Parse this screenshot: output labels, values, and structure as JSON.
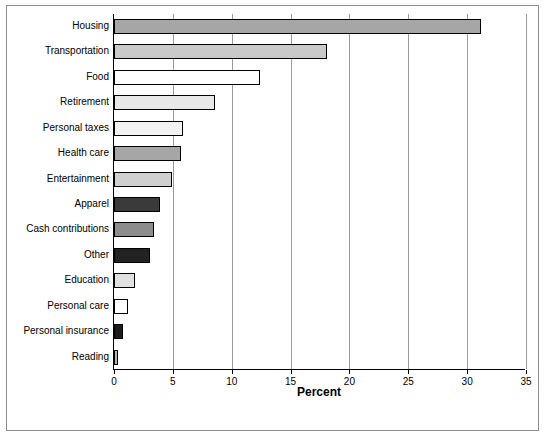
{
  "chart_data": {
    "type": "bar",
    "orientation": "horizontal",
    "title": "",
    "xlabel": "Percent",
    "ylabel": "",
    "xlim": [
      0,
      35
    ],
    "xticks": [
      0,
      5,
      10,
      15,
      20,
      25,
      30,
      35
    ],
    "grid": "vertical",
    "legend": "none",
    "categories": [
      "Housing",
      "Transportation",
      "Food",
      "Retirement",
      "Personal taxes",
      "Health care",
      "Entertainment",
      "Apparel",
      "Cash contributions",
      "Other",
      "Education",
      "Personal care",
      "Personal insurance",
      "Reading"
    ],
    "values": [
      31.2,
      18.1,
      12.4,
      8.6,
      5.9,
      5.7,
      4.9,
      3.9,
      3.4,
      3.1,
      1.8,
      1.2,
      0.8,
      0.3
    ],
    "bar_colors": [
      "#a6a6a6",
      "#c9c9c9",
      "#ffffff",
      "#e8e8e8",
      "#f2f2f2",
      "#a6a6a6",
      "#cfcfcf",
      "#3a3a3a",
      "#8c8c8c",
      "#222222",
      "#e0e0e0",
      "#ffffff",
      "#1c1c1c",
      "#b5b5b5"
    ]
  }
}
